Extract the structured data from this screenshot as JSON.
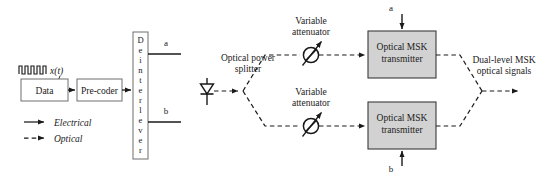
{
  "figure": {
    "colors": {
      "line": "#1a1a1a",
      "box_border": "#6e6e6e",
      "box_fill_white": "#ffffff",
      "box_fill_gray": "#d2d2d2",
      "text": "#1a1a1a",
      "background": "#ffffff"
    }
  },
  "electrical_stage": {
    "waveform_icon": "square-wave-pulse-train",
    "signal_label": "x(t)",
    "data_block": {
      "label": "Data"
    },
    "precoder_block": {
      "label": "Pre-coder"
    },
    "deinterleaver_block": {
      "label": "Deinterleaver",
      "letters": [
        "D",
        "e",
        "i",
        "n",
        "t",
        "e",
        "r",
        "l",
        "e",
        "v",
        "e",
        "r"
      ]
    },
    "outputs": [
      {
        "label": "a"
      },
      {
        "label": "b"
      }
    ]
  },
  "legend": {
    "items": [
      {
        "label": "Electrical",
        "style": "solid",
        "icon": "solid-arrow-icon"
      },
      {
        "label": "Optical",
        "style": "dashed",
        "icon": "dashed-arrow-icon"
      }
    ]
  },
  "optical_stage": {
    "laser_source": {
      "icon": "laser-diode-icon"
    },
    "splitter": {
      "label_line1": "Optical power",
      "label_line2": "splitter"
    },
    "branches": [
      {
        "attenuator": {
          "label_line1": "Variable",
          "label_line2": "attenuator",
          "icon": "variable-attenuator-icon"
        },
        "transmitter": {
          "label_line1": "Optical MSK",
          "label_line2": "transmitter"
        },
        "drive_input": {
          "label": "a",
          "direction": "down"
        }
      },
      {
        "attenuator": {
          "label_line1": "Variable",
          "label_line2": "attenuator",
          "icon": "variable-attenuator-icon"
        },
        "transmitter": {
          "label_line1": "Optical MSK",
          "label_line2": "transmitter"
        },
        "drive_input": {
          "label": "b",
          "direction": "up"
        }
      }
    ],
    "output": {
      "label_line1": "Dual-level MSK",
      "label_line2": "optical signals"
    }
  }
}
